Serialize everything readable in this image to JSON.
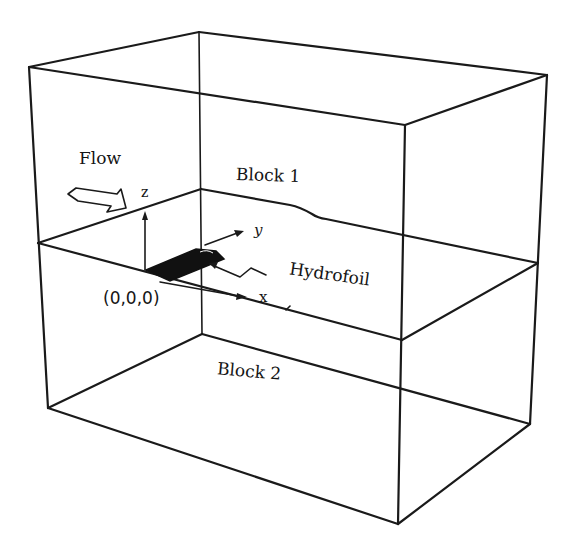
{
  "figure": {
    "labels": {
      "flow": "Flow",
      "block1": "Block 1",
      "block2": "Block 2",
      "hydrofoil": "Hydrofoil",
      "origin": "(0,0,0)",
      "axis_x": "x",
      "axis_y": "y",
      "axis_z": "z"
    },
    "colors": {
      "line": "#1a1a1a",
      "background": "#ffffff",
      "hydrofoil_fill": "#111111"
    },
    "geometry": {
      "top_plane": [
        [
          199,
          32
        ],
        [
          29,
          67
        ],
        [
          405,
          125
        ],
        [
          547,
          75
        ]
      ],
      "interface_plane": [
        [
          201,
          189
        ],
        [
          38,
          243
        ],
        [
          402,
          340
        ],
        [
          538,
          263
        ]
      ],
      "bottom_plane": [
        [
          202,
          334
        ],
        [
          48,
          408
        ],
        [
          398,
          524
        ],
        [
          530,
          424
        ]
      ]
    }
  }
}
